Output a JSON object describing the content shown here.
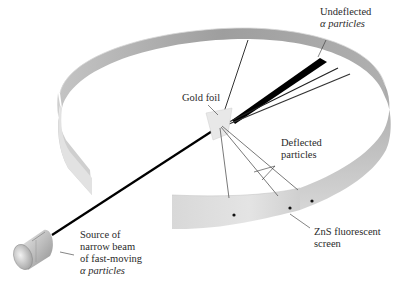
{
  "diagram": {
    "labels": {
      "undeflected": [
        "Undeflected",
        "α particles"
      ],
      "gold_foil": "Gold foil",
      "deflected": [
        "Deflected",
        "particles"
      ],
      "zns_screen": [
        "ZnS fluorescent",
        "screen"
      ],
      "source": [
        "Source of",
        "narrow beam",
        "of fast-moving",
        "α particles"
      ]
    },
    "colors": {
      "background": "#ffffff",
      "screen_outer": "#b8b8b8",
      "screen_inner": "#9a9a9a",
      "screen_front": "#dcdcdc",
      "beam": "#000000",
      "deflected_ray": "#6a6a6a",
      "foil": "#e6e6e6",
      "source_body": "#c9c9c9",
      "text": "#2a2a2a"
    },
    "components": [
      "alpha particle source",
      "gold foil",
      "ZnS fluorescent screen (ring)",
      "undeflected beam",
      "deflected particles",
      "scintillation dots"
    ]
  }
}
